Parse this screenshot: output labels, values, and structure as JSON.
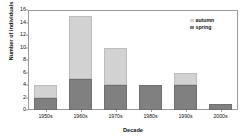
{
  "chart_data": {
    "type": "bar",
    "subtype": "stacked",
    "title": "",
    "xlabel": "Decade",
    "ylabel": "Number of individuals",
    "categories": [
      "1950s",
      "1960s",
      "1970s",
      "1980s",
      "1990s",
      "2000s"
    ],
    "series": [
      {
        "name": "spring",
        "values": [
          2,
          5,
          4,
          4,
          4,
          1
        ],
        "color": "#808080"
      },
      {
        "name": "autumn",
        "values": [
          2,
          10,
          6,
          0,
          2,
          0
        ],
        "color": "#d2d2d2"
      }
    ],
    "totals": [
      4,
      15,
      10,
      4,
      6,
      1
    ],
    "ylim": [
      0,
      16
    ],
    "yticks": [
      0,
      2,
      4,
      6,
      8,
      10,
      12,
      14,
      16
    ],
    "grid": false,
    "legend_position": "top-right",
    "legend": [
      "autumn",
      "spring"
    ]
  },
  "legend": {
    "items": [
      {
        "label": "autumn",
        "color": "#d2d2d2"
      },
      {
        "label": "spring",
        "color": "#808080"
      }
    ]
  },
  "axes": {
    "x_title": "Decade",
    "y_title": "Number of individuals"
  }
}
